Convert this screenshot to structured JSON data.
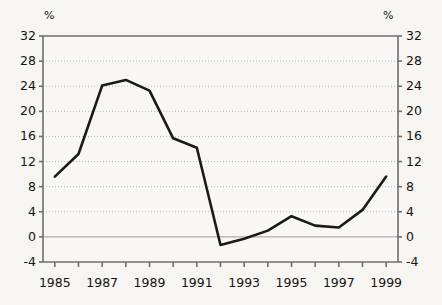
{
  "chart_data": {
    "type": "line",
    "title": "",
    "subtitle": "",
    "xlabel": "",
    "ylabel": "",
    "unit_label_left": "%",
    "unit_label_right": "%",
    "grid": true,
    "legend": null,
    "legend_position": "none",
    "x": [
      1985,
      1986,
      1987,
      1988,
      1989,
      1990,
      1991,
      1992,
      1993,
      1994,
      1995,
      1996,
      1997,
      1998,
      1999
    ],
    "xlim": [
      1984.5,
      1999.5
    ],
    "ylim": [
      -4,
      32
    ],
    "ytick_values": [
      32,
      28,
      24,
      20,
      16,
      12,
      8,
      4,
      0,
      -4
    ],
    "ytick_labels_left": [
      "32",
      "28",
      "24",
      "20",
      "16",
      "12",
      "8",
      "4",
      "0",
      "-4"
    ],
    "ytick_labels_right": [
      "32",
      "28",
      "24",
      "20",
      "16",
      "12",
      "8",
      "4",
      "0",
      "-4"
    ],
    "xtick_values": [
      1985,
      1987,
      1989,
      1991,
      1993,
      1995,
      1997,
      1999
    ],
    "xtick_labels": [
      "1985",
      "1987",
      "1989",
      "1991",
      "1993",
      "1995",
      "1997",
      "1999"
    ],
    "xtick_minor_values": [
      1986,
      1988,
      1990,
      1992,
      1994,
      1996,
      1998
    ],
    "series": [
      {
        "name": "series-1",
        "color": "#1a1a1a",
        "line_width": 2.6,
        "values": [
          9.6,
          13.2,
          24.1,
          25.0,
          23.3,
          15.7,
          14.2,
          -1.3,
          -0.3,
          1.0,
          3.3,
          1.8,
          1.5,
          4.3,
          9.6
        ]
      }
    ],
    "zero_line": 0,
    "colors": {
      "background": "#f6f5f2",
      "plot_background": "#f8f7f4",
      "axis": "#6e6e6e",
      "gridline": "#b9b9b9",
      "zero_line": "#9a9a9a",
      "line": "#1a1a1a",
      "text": "#16130f"
    }
  }
}
